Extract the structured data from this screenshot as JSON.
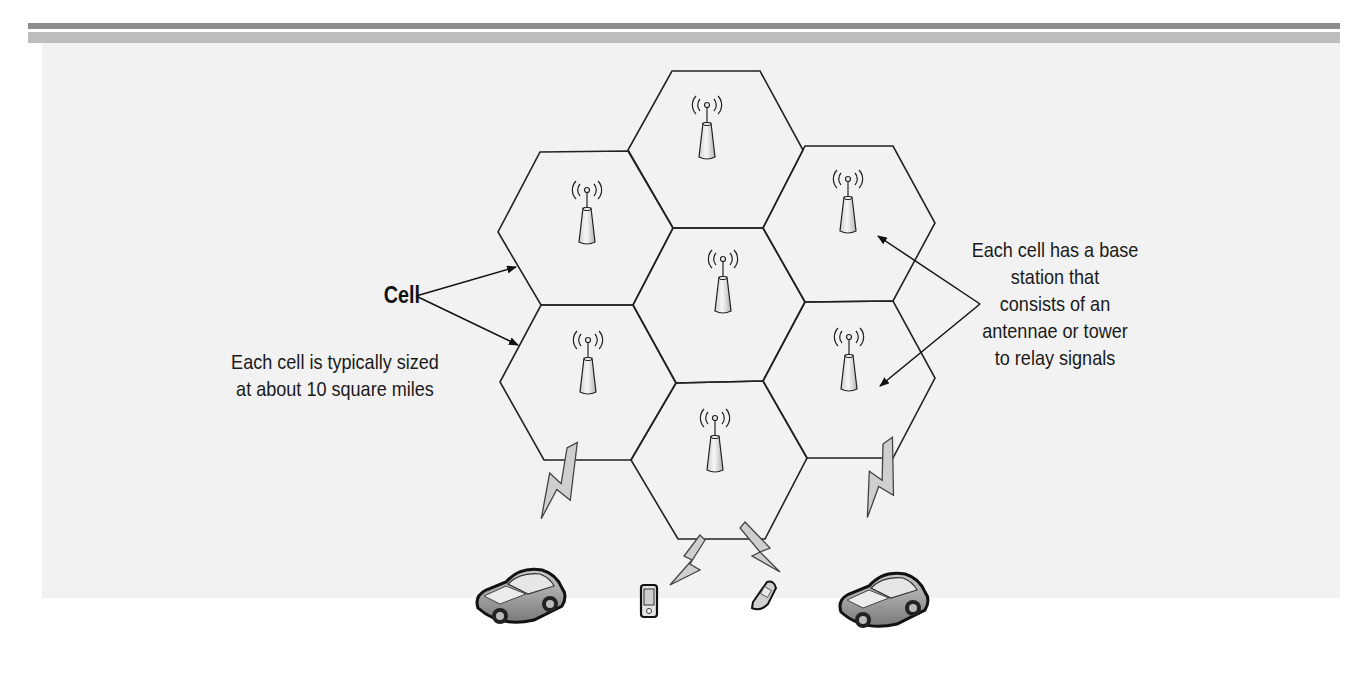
{
  "header": {
    "rule_dark_color": "#8c8c8c",
    "rule_light_color": "#bdbdbd"
  },
  "diagram": {
    "background_color": "#f2f2f2",
    "cells": [
      {
        "id": "top",
        "has_antenna": true
      },
      {
        "id": "upper-left",
        "has_antenna": true
      },
      {
        "id": "upper-right",
        "has_antenna": true
      },
      {
        "id": "center",
        "has_antenna": true
      },
      {
        "id": "lower-left",
        "has_antenna": true
      },
      {
        "id": "lower-right",
        "has_antenna": true
      },
      {
        "id": "bottom",
        "has_antenna": true
      }
    ],
    "devices": [
      {
        "type": "car",
        "icon": "car-icon"
      },
      {
        "type": "pda",
        "icon": "pda-icon"
      },
      {
        "type": "flip-phone",
        "icon": "flip-phone-icon"
      },
      {
        "type": "car",
        "icon": "car-icon"
      }
    ],
    "labels": {
      "cell": "Cell",
      "cell_size_line1": "Each cell is typically sized",
      "cell_size_line2": "at about 10 square miles",
      "base_station_line1": "Each cell has a base",
      "base_station_line2": "station that",
      "base_station_line3": "consists of an",
      "base_station_line4": "antennae or tower",
      "base_station_line5": "to relay signals"
    }
  }
}
